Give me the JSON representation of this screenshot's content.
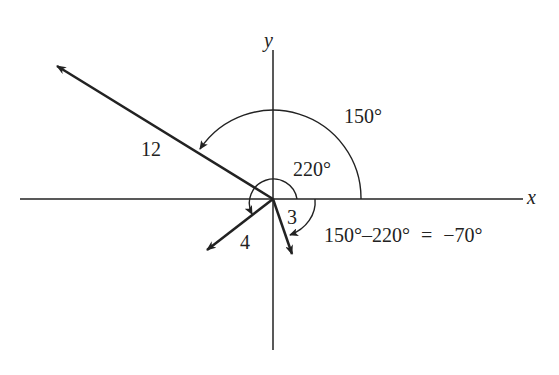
{
  "diagram": {
    "axes": {
      "x_label": "x",
      "y_label": "y"
    },
    "vectors": [
      {
        "id": "v12",
        "magnitude_label": "12"
      },
      {
        "id": "v4",
        "magnitude_label": "4"
      },
      {
        "id": "v3",
        "magnitude_label": "3"
      }
    ],
    "angles": {
      "outer": "150°",
      "inner": "220°",
      "difference": "150°–220° = −70°"
    },
    "colors": {
      "ink": "#222222",
      "background": "#ffffff"
    }
  }
}
